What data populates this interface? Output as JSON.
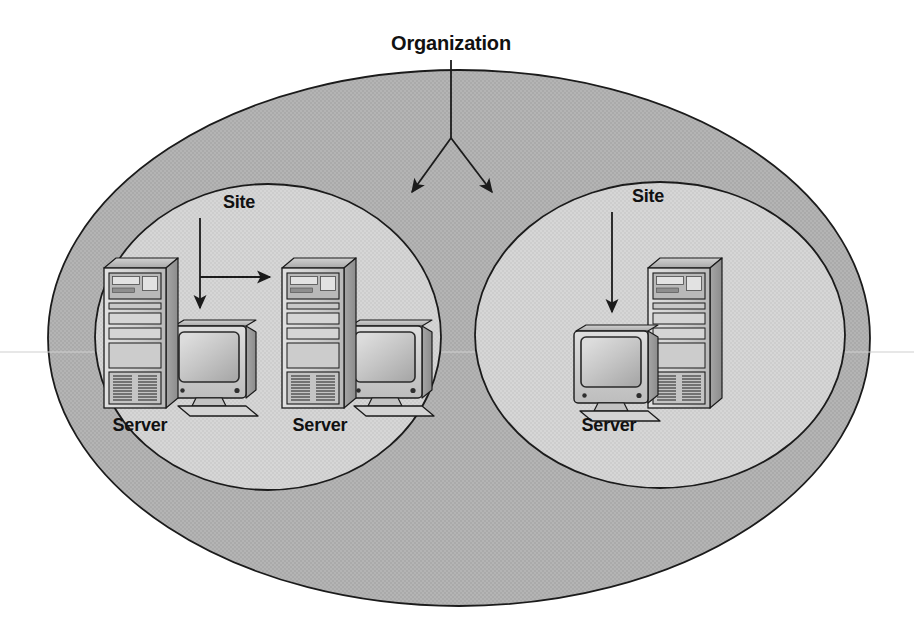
{
  "diagram": {
    "title_label": "Organization",
    "organization": {
      "label": "Organization",
      "shape": "ellipse",
      "fill_color": "#b2b2b2",
      "border_color": "#1b1b1b"
    },
    "sites": [
      {
        "label": "Site",
        "shape": "circle",
        "fill_color": "#d4d4d4",
        "border_color": "#1b1b1b",
        "servers": [
          {
            "label": "Server",
            "layout": "tower-left-monitor-right"
          },
          {
            "label": "Server",
            "layout": "tower-left-monitor-right"
          }
        ]
      },
      {
        "label": "Site",
        "shape": "circle",
        "fill_color": "#d4d4d4",
        "border_color": "#1b1b1b",
        "servers": [
          {
            "label": "Server",
            "layout": "monitor-left-tower-right"
          }
        ]
      }
    ],
    "connectors": [
      {
        "name": "organization-pointer-left",
        "from": "Organization",
        "to": "Site 1",
        "style": "arrow"
      },
      {
        "name": "organization-pointer-right",
        "from": "Organization",
        "to": "Site 2",
        "style": "arrow"
      },
      {
        "name": "site-pointer-left-down",
        "from": "Site",
        "to": "site area",
        "style": "arrow"
      },
      {
        "name": "site-pointer-left-right",
        "from": "Site",
        "to": "Server",
        "style": "arrow"
      },
      {
        "name": "site-pointer-right-down",
        "from": "Site",
        "to": "site area",
        "style": "arrow"
      }
    ],
    "colors": {
      "outer_fill": "#b2b2b2",
      "inner_fill": "#d4d4d4",
      "line": "#1b1b1b",
      "background": "#ffffff",
      "device_light": "#d8d8d8",
      "device_mid": "#b4b4b4",
      "device_dark": "#8f8f8f"
    }
  }
}
